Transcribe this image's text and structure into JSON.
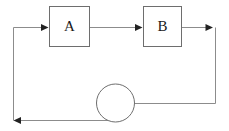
{
  "diagram": {
    "type": "block-diagram",
    "canvas": {
      "width": 229,
      "height": 131,
      "background": "#ffffff"
    },
    "colors": {
      "wire": "#8c8c8c",
      "node_stroke": "#6e6e6e",
      "node_fill": "#ffffff",
      "arrow": "#222222",
      "label": "#1a1a1a"
    },
    "nodes": [
      {
        "id": "block-a",
        "label": "A",
        "shape": "rectangle",
        "x": 49,
        "y": 6,
        "width": 40,
        "height": 40
      },
      {
        "id": "block-b",
        "label": "B",
        "shape": "rectangle",
        "x": 143,
        "y": 6,
        "width": 39,
        "height": 40
      },
      {
        "id": "summing-junction",
        "label": "",
        "shape": "circle",
        "cx": 115,
        "cy": 103,
        "r": 19
      }
    ],
    "edges": [
      {
        "id": "edge-input-to-a",
        "from": "left-rail",
        "to": "block-a",
        "path": "M 13 27 L 46 27",
        "arrow": {
          "x": 48,
          "y": 27,
          "direction": "right"
        }
      },
      {
        "id": "edge-a-to-b",
        "from": "block-a",
        "to": "block-b",
        "path": "M 89 27 L 140 27",
        "arrow": {
          "x": 142,
          "y": 27,
          "direction": "right"
        }
      },
      {
        "id": "edge-b-to-right-rail",
        "from": "block-b",
        "to": "right-rail",
        "path": "M 182 27 L 210 27",
        "arrow": {
          "x": 212,
          "y": 27,
          "direction": "right"
        }
      },
      {
        "id": "edge-right-rail-down",
        "from": "right-rail-top",
        "to": "right-rail-bottom",
        "path": "M 215 27 L 215 103",
        "arrow": null
      },
      {
        "id": "edge-right-rail-to-summing",
        "from": "right-rail",
        "to": "summing-junction",
        "path": "M 215 103 L 119 103",
        "arrow": {
          "x": 117,
          "y": 103,
          "direction": "left"
        }
      },
      {
        "id": "edge-summing-to-bottom-rail",
        "from": "summing-junction",
        "to": "left-rail-bottom",
        "path": "M 122 120 L 17 120",
        "arrow": {
          "x": 14,
          "y": 120,
          "direction": "left"
        }
      },
      {
        "id": "edge-left-rail-up",
        "from": "left-rail-bottom",
        "to": "left-rail-top",
        "path": "M 13 120 L 13 27",
        "arrow": null
      }
    ]
  }
}
